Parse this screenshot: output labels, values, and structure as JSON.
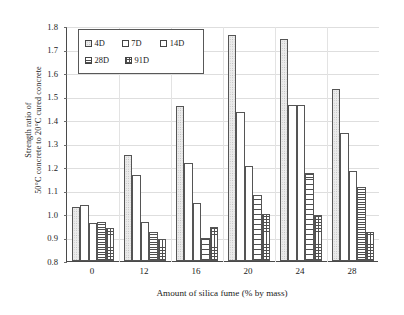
{
  "chart_data": {
    "type": "bar",
    "title": "",
    "xlabel": "Amount of silica fume (% by mass)",
    "ylabel_line1": "Strength ratio of",
    "ylabel_line2": "50°C concrete to 20°C cured concrete",
    "categories": [
      "0",
      "12",
      "16",
      "20",
      "24",
      "28"
    ],
    "ylim": [
      0.8,
      1.8
    ],
    "yticks": [
      "0.8",
      "0.9",
      "1.0",
      "1.1",
      "1.2",
      "1.3",
      "1.4",
      "1.5",
      "1.6",
      "1.7",
      "1.8"
    ],
    "grid": true,
    "legend_position": "upper-left-inside",
    "series": [
      {
        "name": "4D",
        "pattern": "dots",
        "values": [
          1.03,
          1.25,
          1.46,
          1.76,
          1.745,
          1.53
        ]
      },
      {
        "name": "7D",
        "pattern": "blank",
        "values": [
          1.04,
          1.165,
          1.215,
          1.435,
          1.465,
          1.345
        ]
      },
      {
        "name": "14D",
        "pattern": "blank",
        "values": [
          0.96,
          0.965,
          1.045,
          1.205,
          1.465,
          1.185
        ]
      },
      {
        "name": "28D",
        "pattern": "hlines",
        "values": [
          0.965,
          0.925,
          0.9,
          1.08,
          1.175,
          1.115
        ]
      },
      {
        "name": "91D",
        "pattern": "grid",
        "values": [
          0.94,
          0.895,
          0.945,
          1.0,
          0.995,
          0.925
        ]
      }
    ]
  },
  "legend": {
    "items": [
      {
        "label": "4D"
      },
      {
        "label": "7D"
      },
      {
        "label": "14D"
      },
      {
        "label": "28D"
      },
      {
        "label": "91D"
      }
    ]
  }
}
